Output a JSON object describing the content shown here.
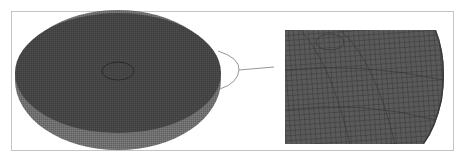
{
  "figure": {
    "left_panel": {
      "subject": "full-disk-mesh",
      "colors": {
        "mesh_face": "#3f3f3f",
        "mesh_line": "#5a5a5a",
        "side_wall": "#6b6b6b"
      }
    },
    "callout": {
      "shape": "semicircle-arc",
      "color": "#8a8a8a"
    },
    "right_panel": {
      "subject": "zoomed-edge-mesh",
      "colors": {
        "mesh_face": "#555555",
        "mesh_line": "#333333"
      }
    },
    "frame_color": "#c4c4c4"
  }
}
